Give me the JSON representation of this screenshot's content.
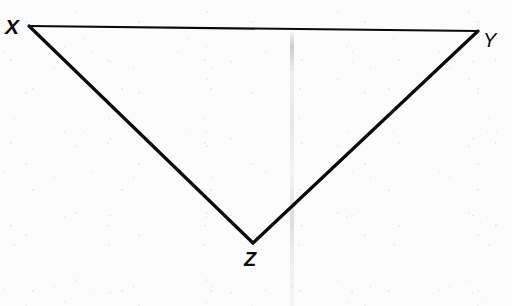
{
  "figure": {
    "kind": "geometry-diagram",
    "shape": "triangle",
    "name": "Triangle XYZ",
    "orientation": "inverted",
    "background_color": "#fcfcfc",
    "stroke_color": "#0a0a0a",
    "vertices": [
      {
        "id": "X",
        "label": "X",
        "x": 29,
        "y": 26,
        "label_x": 13,
        "label_y": 27,
        "label_weight": "bold"
      },
      {
        "id": "Y",
        "label": "Y",
        "x": 478,
        "y": 31,
        "label_x": 491,
        "label_y": 41,
        "label_weight": "regular"
      },
      {
        "id": "Z",
        "label": "Z",
        "x": 253,
        "y": 243,
        "label_x": 252,
        "label_y": 260,
        "label_weight": "bold"
      }
    ],
    "edges": [
      {
        "id": "XY",
        "from": "X",
        "to": "Y",
        "stroke_width": 2.2
      },
      {
        "id": "XZ",
        "from": "X",
        "to": "Z",
        "stroke_width": 3.2
      },
      {
        "id": "ZY",
        "from": "Z",
        "to": "Y",
        "stroke_width": 3.2
      }
    ],
    "artifacts": {
      "crease_label": "vertical scan crease",
      "crease_x": 292,
      "grain_label": "photocopy speckle grain"
    }
  }
}
